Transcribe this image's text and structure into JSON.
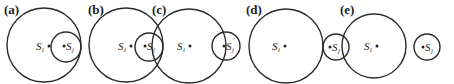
{
  "figure": {
    "panels": [
      {
        "label": "(a)",
        "relation": "inside-tangent",
        "node_i": "S",
        "sub_i": "i",
        "node_j": "S",
        "sub_j": "j"
      },
      {
        "label": "(b)",
        "relation": "inside-touching",
        "node_i": "S",
        "sub_i": "i",
        "node_j": "S",
        "sub_j": "j"
      },
      {
        "label": "(c)",
        "relation": "overlapping",
        "node_i": "S",
        "sub_i": "i",
        "node_j": "S",
        "sub_j": "j"
      },
      {
        "label": "(d)",
        "relation": "externally-tangent",
        "node_i": "S",
        "sub_i": "i",
        "node_j": "S",
        "sub_j": "j"
      },
      {
        "label": "(e)",
        "relation": "separate",
        "node_i": "S",
        "sub_i": "i",
        "node_j": "S",
        "sub_j": "j"
      }
    ]
  }
}
